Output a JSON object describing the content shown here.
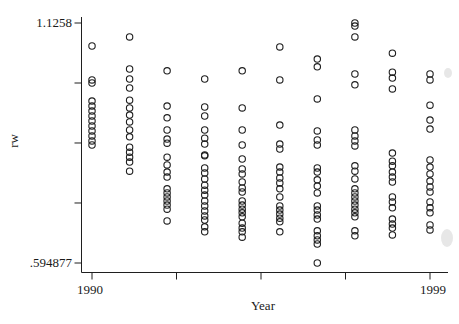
{
  "figure": {
    "background": "#ffffff",
    "ink": "#1f1f1f"
  },
  "chart_data": {
    "type": "scatter",
    "title": "",
    "xlabel": "Year",
    "ylabel": "rw",
    "marker": "open-circle",
    "grid": false,
    "legend": "none",
    "x_axis": {
      "min": 1990,
      "max": 1999,
      "ticks": [
        1990,
        1992.25,
        1994.5,
        1996.75,
        1999
      ],
      "tick_labels": [
        "1990",
        "1999"
      ]
    },
    "y_axis": {
      "min": 0.594877,
      "max": 1.1258,
      "ticks": [
        0.594877,
        0.727608,
        0.860339,
        0.993069,
        1.1258
      ],
      "tick_labels": [
        "1.1258",
        ".594877"
      ]
    },
    "series": [
      {
        "year": 1990,
        "values": [
          1.075,
          1.0,
          0.993,
          0.953,
          0.942,
          0.931,
          0.92,
          0.909,
          0.898,
          0.887,
          0.876,
          0.865,
          0.856
        ]
      },
      {
        "year": 1991,
        "values": [
          1.095,
          1.024,
          1.002,
          0.982,
          0.955,
          0.938,
          0.922,
          0.907,
          0.889,
          0.874,
          0.851,
          0.84,
          0.829,
          0.818,
          0.798
        ]
      },
      {
        "year": 1992,
        "values": [
          1.02,
          0.942,
          0.916,
          0.889,
          0.869,
          0.86,
          0.829,
          0.812,
          0.796,
          0.785,
          0.759,
          0.75,
          0.741,
          0.732,
          0.723,
          0.714,
          0.688
        ]
      },
      {
        "year": 1993,
        "values": [
          1.002,
          0.94,
          0.92,
          0.889,
          0.871,
          0.858,
          0.834,
          0.832,
          0.805,
          0.794,
          0.781,
          0.767,
          0.756,
          0.745,
          0.732,
          0.721,
          0.71,
          0.699,
          0.69,
          0.675,
          0.664
        ]
      },
      {
        "year": 1994,
        "values": [
          1.02,
          0.938,
          0.889,
          0.856,
          0.825,
          0.803,
          0.792,
          0.774,
          0.761,
          0.752,
          0.732,
          0.723,
          0.714,
          0.706,
          0.697,
          0.683,
          0.672,
          0.664,
          0.652
        ]
      },
      {
        "year": 1995,
        "values": [
          1.073,
          1.0,
          0.9,
          0.858,
          0.847,
          0.807,
          0.796,
          0.783,
          0.772,
          0.759,
          0.741,
          0.721,
          0.712,
          0.703,
          0.694,
          0.686,
          0.664
        ]
      },
      {
        "year": 1996,
        "values": [
          1.046,
          1.029,
          0.958,
          0.887,
          0.867,
          0.856,
          0.805,
          0.796,
          0.779,
          0.765,
          0.75,
          0.721,
          0.712,
          0.701,
          0.692,
          0.666,
          0.655,
          0.646,
          0.637,
          0.594877
        ]
      },
      {
        "year": 1997,
        "values": [
          1.1258,
          1.119,
          1.095,
          1.013,
          0.989,
          0.889,
          0.876,
          0.865,
          0.854,
          0.81,
          0.798,
          0.781,
          0.759,
          0.75,
          0.741,
          0.732,
          0.723,
          0.714,
          0.706,
          0.697,
          0.666,
          0.655
        ]
      },
      {
        "year": 1998,
        "values": [
          1.059,
          1.017,
          1.004,
          0.98,
          0.838,
          0.82,
          0.81,
          0.796,
          0.785,
          0.774,
          0.741,
          0.73,
          0.717,
          0.692,
          0.681,
          0.672,
          0.657
        ]
      },
      {
        "year": 1999,
        "values": [
          1.013,
          1.0,
          0.944,
          0.911,
          0.891,
          0.823,
          0.807,
          0.792,
          0.776,
          0.763,
          0.752,
          0.73,
          0.717,
          0.706,
          0.679,
          0.668
        ]
      }
    ]
  }
}
